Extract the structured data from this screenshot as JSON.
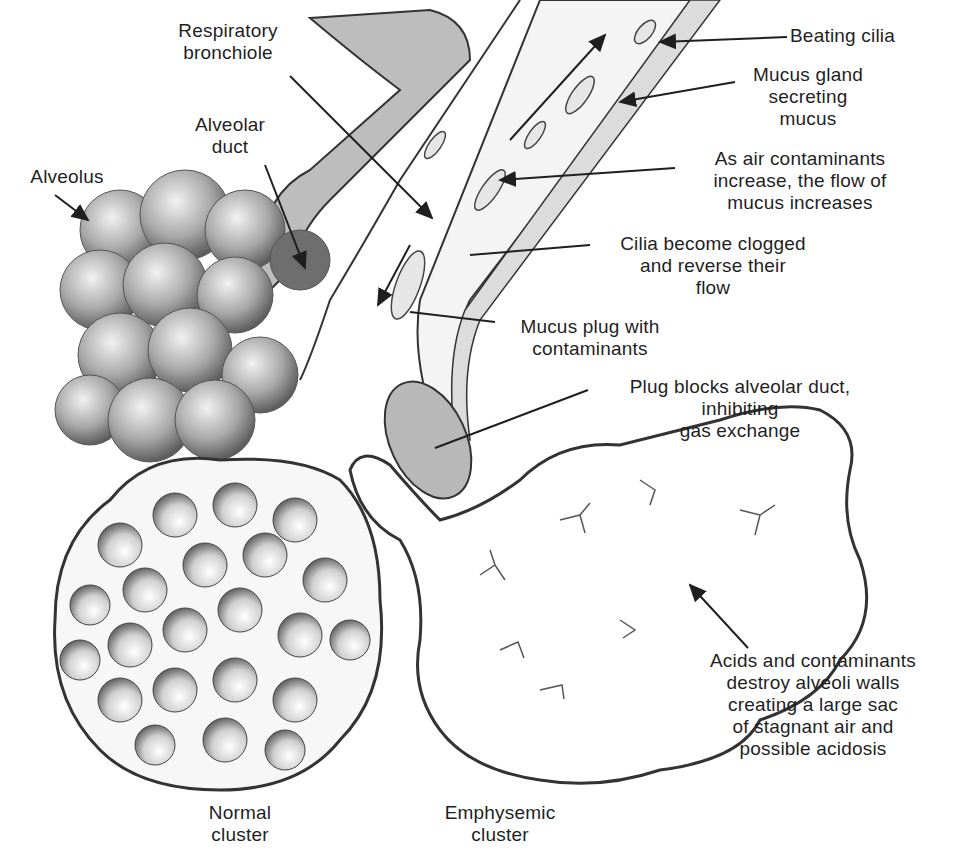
{
  "colors": {
    "ink": "#1f1f1f",
    "shading": "#9a9a9a",
    "background": "#ffffff"
  },
  "labels": {
    "respiratory_bronchiole": "Respiratory\nbronchiole",
    "alveolar_duct": "Alveolar\nduct",
    "alveolus": "Alveolus",
    "beating_cilia": "Beating cilia",
    "mucus_gland": "Mucus gland\nsecreting\nmucus",
    "contaminants_increase": "As air contaminants\nincrease, the flow of\nmucus increases",
    "cilia_clogged": "Cilia become clogged\nand reverse their\nflow",
    "mucus_plug": "Mucus plug with\ncontaminants",
    "plug_blocks": "Plug blocks alveolar duct,\ninhibiting\ngas exchange",
    "acids_destroy": "Acids and contaminants\ndestroy alveoli walls\ncreating a large sac\nof stagnant air and\npossible acidosis",
    "normal_cluster": "Normal\ncluster",
    "emphysemic_cluster": "Emphysemic\ncluster"
  }
}
